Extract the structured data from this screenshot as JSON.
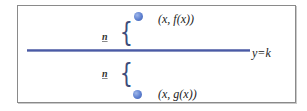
{
  "diagram": {
    "line_label": "y=k",
    "upper_point_label": "(x, f(x))",
    "lower_point_label": "(x, g(x))",
    "upper_distance_label": "n",
    "lower_distance_label": "n",
    "brace_glyph": "{",
    "colors": {
      "line": "#4a5aa6",
      "point": "#5d7fcf",
      "brace": "#3c4c7a",
      "frame": "#8a8a8a"
    }
  }
}
